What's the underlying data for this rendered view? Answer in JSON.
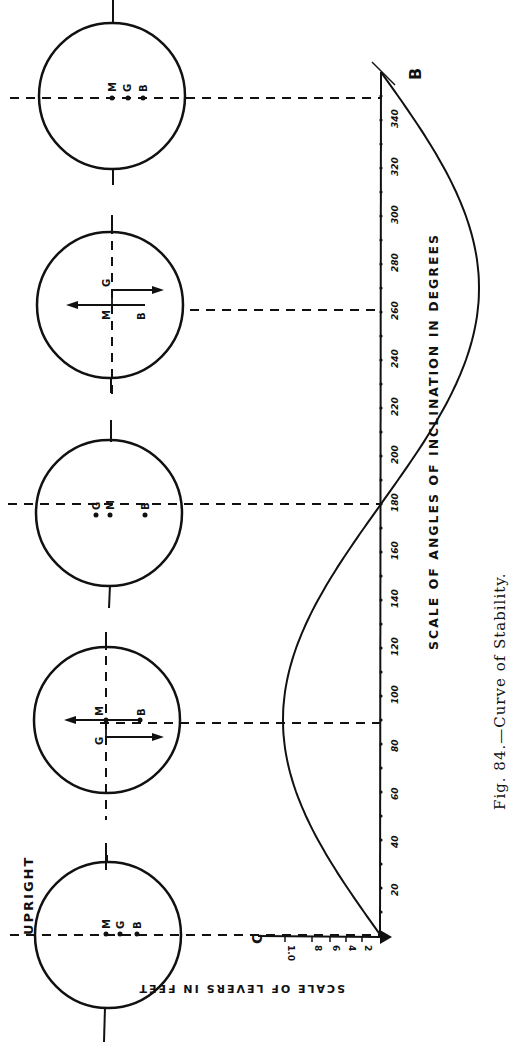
{
  "figure": {
    "caption": "Fig. 84.—Curve of Stability.",
    "upright_label": "UPRIGHT",
    "point_b_label": "B",
    "point_c_label": "C"
  },
  "chart_data": {
    "type": "line",
    "title": "Curve of Stability",
    "xlabel": "SCALE OF ANGLES OF INCLINATION IN DEGREES",
    "ylabel": "SCALE OF LEVERS IN FEET",
    "orientation": "rotated 90° counter-clockwise on page",
    "x_ticks": [
      20,
      40,
      60,
      80,
      100,
      120,
      140,
      160,
      180,
      200,
      220,
      240,
      260,
      280,
      300,
      320,
      340
    ],
    "x_tick_labels": [
      "20",
      "40",
      "60",
      "80",
      "100",
      "120",
      "140",
      "160",
      "180",
      "200",
      "220",
      "240",
      "260",
      "280",
      "300",
      "320",
      "340"
    ],
    "y_tick_labels": [
      "2",
      "4",
      "6",
      "8",
      "1.0"
    ],
    "xlim": [
      0,
      360
    ],
    "ylim": [
      -1.0,
      1.0
    ],
    "series": [
      {
        "name": "Righting lever (GZ)",
        "x": [
          0,
          20,
          40,
          60,
          80,
          90,
          100,
          120,
          140,
          160,
          180,
          200,
          220,
          240,
          260,
          270,
          280,
          300,
          320,
          340,
          360
        ],
        "y": [
          0,
          0.34,
          0.64,
          0.87,
          0.98,
          1.0,
          0.98,
          0.87,
          0.64,
          0.34,
          0,
          -0.34,
          -0.64,
          -0.87,
          -0.98,
          -1.0,
          -0.98,
          -0.87,
          -0.64,
          -0.34,
          0
        ]
      }
    ],
    "annotations": [
      {
        "angle": 0,
        "label": "UPRIGHT",
        "points": [
          "M",
          "G",
          "B"
        ]
      },
      {
        "angle": 90,
        "points": [
          "M",
          "G",
          "B"
        ],
        "note": "couple arrows"
      },
      {
        "angle": 180,
        "points": [
          "G",
          "M",
          "B"
        ]
      },
      {
        "angle": 270,
        "points": [
          "G",
          "M",
          "B"
        ],
        "note": "couple arrows"
      },
      {
        "angle": 360,
        "points": [
          "M",
          "G",
          "B"
        ]
      }
    ],
    "grid": false,
    "legend": "none"
  },
  "circles": [
    {
      "angle": 0,
      "labels": [
        "M",
        "G",
        "B"
      ]
    },
    {
      "angle": 90,
      "labels": [
        "M",
        "B",
        "G"
      ]
    },
    {
      "angle": 180,
      "labels": [
        "G",
        "M",
        "B"
      ]
    },
    {
      "angle": 270,
      "labels": [
        "G",
        "M",
        "B"
      ]
    },
    {
      "angle": 360,
      "labels": [
        "M",
        "G",
        "B"
      ]
    }
  ]
}
